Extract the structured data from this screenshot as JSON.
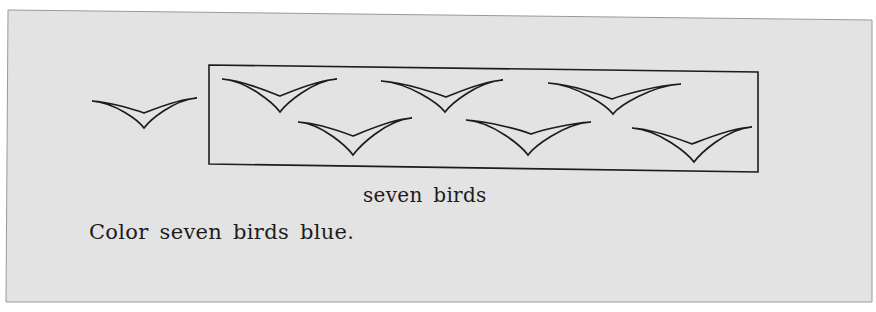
{
  "page": {
    "background": "#ffffff",
    "paper_color": "#e3e3e3",
    "ink_color": "#1c1c1c",
    "paper_corners": [
      [
        8,
        10
      ],
      [
        872,
        20
      ],
      [
        872,
        302
      ],
      [
        6,
        302
      ]
    ]
  },
  "worksheet": {
    "caption": "seven birds",
    "instruction": "Color seven birds blue.",
    "box": {
      "corners": [
        [
          209,
          65
        ],
        [
          758,
          72
        ],
        [
          758,
          172
        ],
        [
          209,
          164
        ]
      ]
    },
    "outside_bird": {
      "left_tip": [
        92,
        101
      ],
      "right_tip": [
        197,
        98
      ],
      "inner_vertex": [
        144,
        113
      ],
      "outer_vertex": [
        144,
        128
      ]
    },
    "boxed_birds": [
      {
        "left_tip": [
          222,
          79
        ],
        "right_tip": [
          337,
          79
        ],
        "inner_vertex": [
          280,
          96
        ],
        "outer_vertex": [
          280,
          112
        ]
      },
      {
        "left_tip": [
          381,
          81
        ],
        "right_tip": [
          503,
          80
        ],
        "inner_vertex": [
          446,
          97
        ],
        "outer_vertex": [
          445,
          112
        ]
      },
      {
        "left_tip": [
          548,
          83
        ],
        "right_tip": [
          681,
          84
        ],
        "inner_vertex": [
          612,
          99
        ],
        "outer_vertex": [
          613,
          114
        ]
      },
      {
        "left_tip": [
          298,
          122
        ],
        "right_tip": [
          412,
          118
        ],
        "inner_vertex": [
          353,
          136
        ],
        "outer_vertex": [
          353,
          155
        ]
      },
      {
        "left_tip": [
          466,
          120
        ],
        "right_tip": [
          591,
          122
        ],
        "inner_vertex": [
          531,
          134
        ],
        "outer_vertex": [
          528,
          155
        ]
      },
      {
        "left_tip": [
          632,
          128
        ],
        "right_tip": [
          752,
          127
        ],
        "inner_vertex": [
          692,
          144
        ],
        "outer_vertex": [
          694,
          162
        ]
      }
    ],
    "bird_count_in_box": 6,
    "bird_count_total": 7
  }
}
